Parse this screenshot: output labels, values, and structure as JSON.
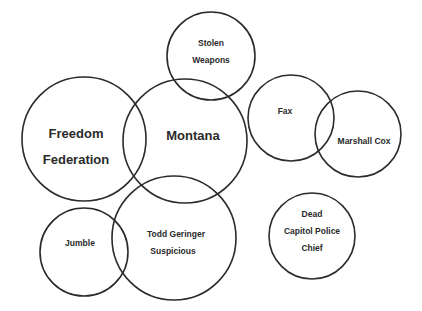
{
  "diagram": {
    "type": "overlapping-circles",
    "nodes": [
      {
        "id": "stolen-weapons",
        "lines": [
          "Stolen",
          "Weapons"
        ],
        "cx": 211,
        "cy": 56,
        "r": 44,
        "size": "small"
      },
      {
        "id": "freedom-federation",
        "lines": [
          "Freedom",
          "Federation"
        ],
        "cx": 84,
        "cy": 139,
        "r": 62,
        "size": "big"
      },
      {
        "id": "montana",
        "lines": [
          "Montana"
        ],
        "cx": 185,
        "cy": 141,
        "r": 62,
        "size": "big"
      },
      {
        "id": "fax",
        "lines": [
          "Fax"
        ],
        "cx": 291,
        "cy": 118,
        "r": 43,
        "size": "small"
      },
      {
        "id": "marshall-cox",
        "lines": [
          "Marshall Cox"
        ],
        "cx": 358,
        "cy": 134,
        "r": 43,
        "size": "small"
      },
      {
        "id": "jumble",
        "lines": [
          "Jumble"
        ],
        "cx": 84,
        "cy": 252,
        "r": 44,
        "size": "small"
      },
      {
        "id": "todd-geringer",
        "lines": [
          "Todd Geringer",
          "Suspicious"
        ],
        "cx": 174,
        "cy": 238,
        "r": 62,
        "size": "small"
      },
      {
        "id": "dead-capitol-police-chief",
        "lines": [
          "Dead",
          "Capitol Police",
          "Chief"
        ],
        "cx": 312,
        "cy": 236,
        "r": 43,
        "size": "small"
      }
    ]
  },
  "labels": {
    "stolen_weapons_1": "Stolen",
    "stolen_weapons_2": "Weapons",
    "freedom_1": "Freedom",
    "freedom_2": "Federation",
    "montana": "Montana",
    "fax": "Fax",
    "marshall_cox": "Marshall Cox",
    "jumble": "Jumble",
    "todd_1": "Todd Geringer",
    "todd_2": "Suspicious",
    "dead_1": "Dead",
    "dead_2": "Capitol Police",
    "dead_3": "Chief"
  },
  "colors": {
    "stroke": "#2b2b2b",
    "text": "#2a2a2a",
    "background": "#ffffff"
  }
}
